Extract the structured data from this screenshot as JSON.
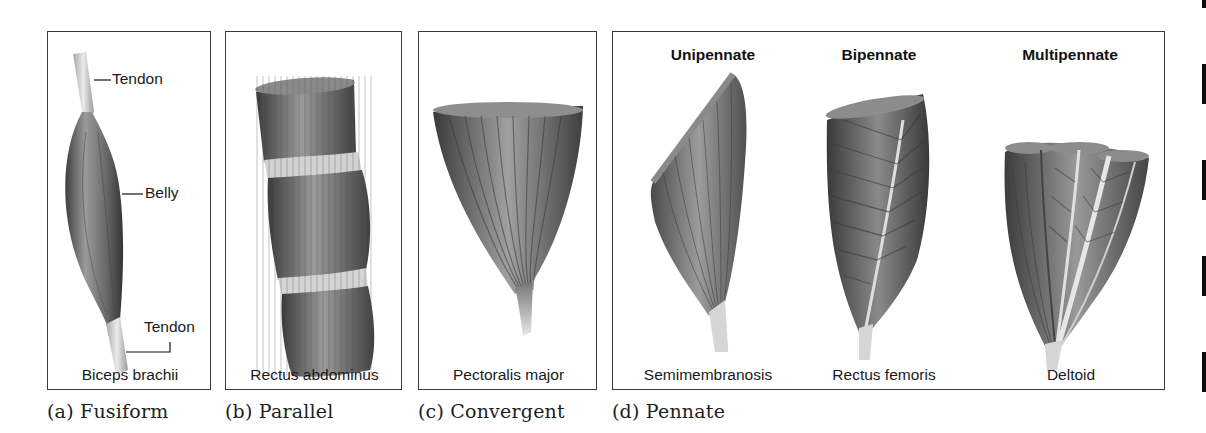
{
  "figure": {
    "panels": [
      {
        "id": "a",
        "caption": "(a) Fusiform",
        "muscle": "Biceps brachii",
        "labels": {
          "tendon_top": "Tendon",
          "belly": "Belly",
          "tendon_bottom": "Tendon"
        }
      },
      {
        "id": "b",
        "caption": "(b) Parallel",
        "muscle": "Rectus abdominus"
      },
      {
        "id": "c",
        "caption": "(c) Convergent",
        "muscle": "Pectoralis major"
      },
      {
        "id": "d",
        "caption": "(d) Pennate",
        "subtypes": [
          {
            "heading": "Unipennate",
            "muscle": "Semimembranosis"
          },
          {
            "heading": "Bipennate",
            "muscle": "Rectus femoris"
          },
          {
            "heading": "Multipennate",
            "muscle": "Deltoid"
          }
        ]
      }
    ],
    "colors": {
      "border": "#3a3a3a",
      "muscle_dark": "#3c3c3c",
      "muscle_mid": "#7a7a7a",
      "muscle_light": "#c4c4c4",
      "tendon": "#d8d8d8"
    }
  }
}
